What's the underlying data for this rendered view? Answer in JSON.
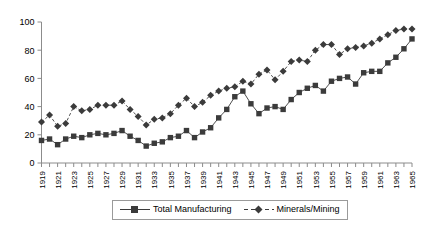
{
  "chart_data": {
    "type": "line",
    "title": "",
    "subtitle": "",
    "xlabel": "",
    "ylabel": "",
    "xlim": [
      1919,
      1965
    ],
    "ylim": [
      0,
      100
    ],
    "yticks": [
      0,
      20,
      40,
      60,
      80,
      100
    ],
    "ytick_labels": [
      "0",
      "20",
      "40",
      "60",
      "80",
      "100"
    ],
    "grid": false,
    "legend_position": "bottom-center",
    "x": [
      1919,
      1920,
      1921,
      1922,
      1923,
      1924,
      1925,
      1926,
      1927,
      1928,
      1929,
      1930,
      1931,
      1932,
      1933,
      1934,
      1935,
      1936,
      1937,
      1938,
      1939,
      1940,
      1941,
      1942,
      1943,
      1944,
      1945,
      1946,
      1947,
      1948,
      1949,
      1950,
      1951,
      1952,
      1953,
      1954,
      1955,
      1956,
      1957,
      1958,
      1959,
      1960,
      1961,
      1962,
      1963,
      1964,
      1965
    ],
    "xtick_labels": [
      "1919",
      "1921",
      "1923",
      "1925",
      "1927",
      "1929",
      "1931",
      "1933",
      "1935",
      "1937",
      "1939",
      "1941",
      "1943",
      "1945",
      "1947",
      "1949",
      "1951",
      "1953",
      "1955",
      "1957",
      "1959",
      "1961",
      "1963",
      "1965"
    ],
    "series": [
      {
        "name": "Total Manufacturing",
        "marker": "square",
        "line_style": "solid",
        "color": "#3b3b3b",
        "values": [
          16,
          17,
          13,
          17,
          19,
          18,
          20,
          21,
          20,
          21,
          23,
          19,
          16,
          12,
          14,
          15,
          18,
          19,
          23,
          18,
          22,
          25,
          32,
          38,
          47,
          51,
          42,
          35,
          39,
          40,
          38,
          45,
          50,
          53,
          55,
          51,
          58,
          60,
          61,
          56,
          64,
          65,
          65,
          71,
          75,
          81,
          88
        ]
      },
      {
        "name": "Minerals/Mining",
        "marker": "diamond",
        "line_style": "dashed",
        "color": "#3b3b3b",
        "values": [
          29,
          34,
          26,
          28,
          40,
          37,
          38,
          41,
          41,
          41,
          44,
          38,
          33,
          27,
          31,
          32,
          35,
          41,
          46,
          40,
          43,
          48,
          51,
          53,
          54,
          58,
          56,
          63,
          66,
          59,
          65,
          72,
          73,
          72,
          80,
          84,
          84,
          77,
          81,
          82,
          83,
          85,
          88,
          91,
          94,
          95,
          95
        ]
      }
    ]
  },
  "legend": {
    "entries": [
      {
        "label": "Total Manufacturing",
        "marker": "square-marker-icon"
      },
      {
        "label": "Minerals/Mining",
        "marker": "diamond-marker-icon"
      }
    ]
  },
  "axes": {
    "y_axis_name": "value-axis",
    "x_axis_name": "year-axis"
  }
}
